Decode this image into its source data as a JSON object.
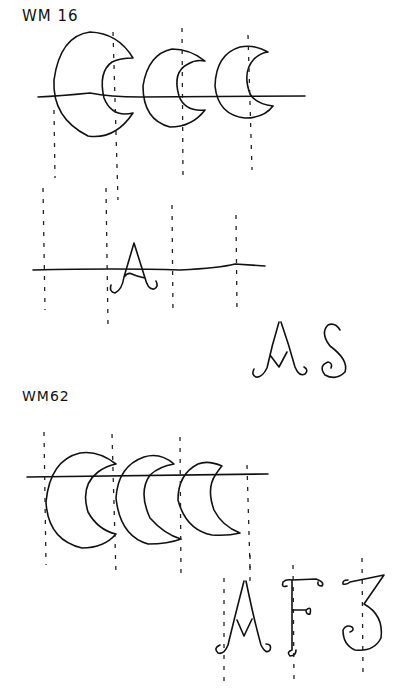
{
  "diagram": {
    "sections": [
      {
        "id": "wm16",
        "label": "WM 16",
        "motif": "interlocking crescents",
        "crescent_count": 3,
        "letters_on_line": [
          "A"
        ],
        "monogram": "AS"
      },
      {
        "id": "wm62",
        "label": "WM62",
        "motif": "interlocking crescents",
        "crescent_count": 3,
        "monogram": "AF3"
      }
    ],
    "colors": {
      "ink": "#111111",
      "paper": "#ffffff"
    }
  }
}
